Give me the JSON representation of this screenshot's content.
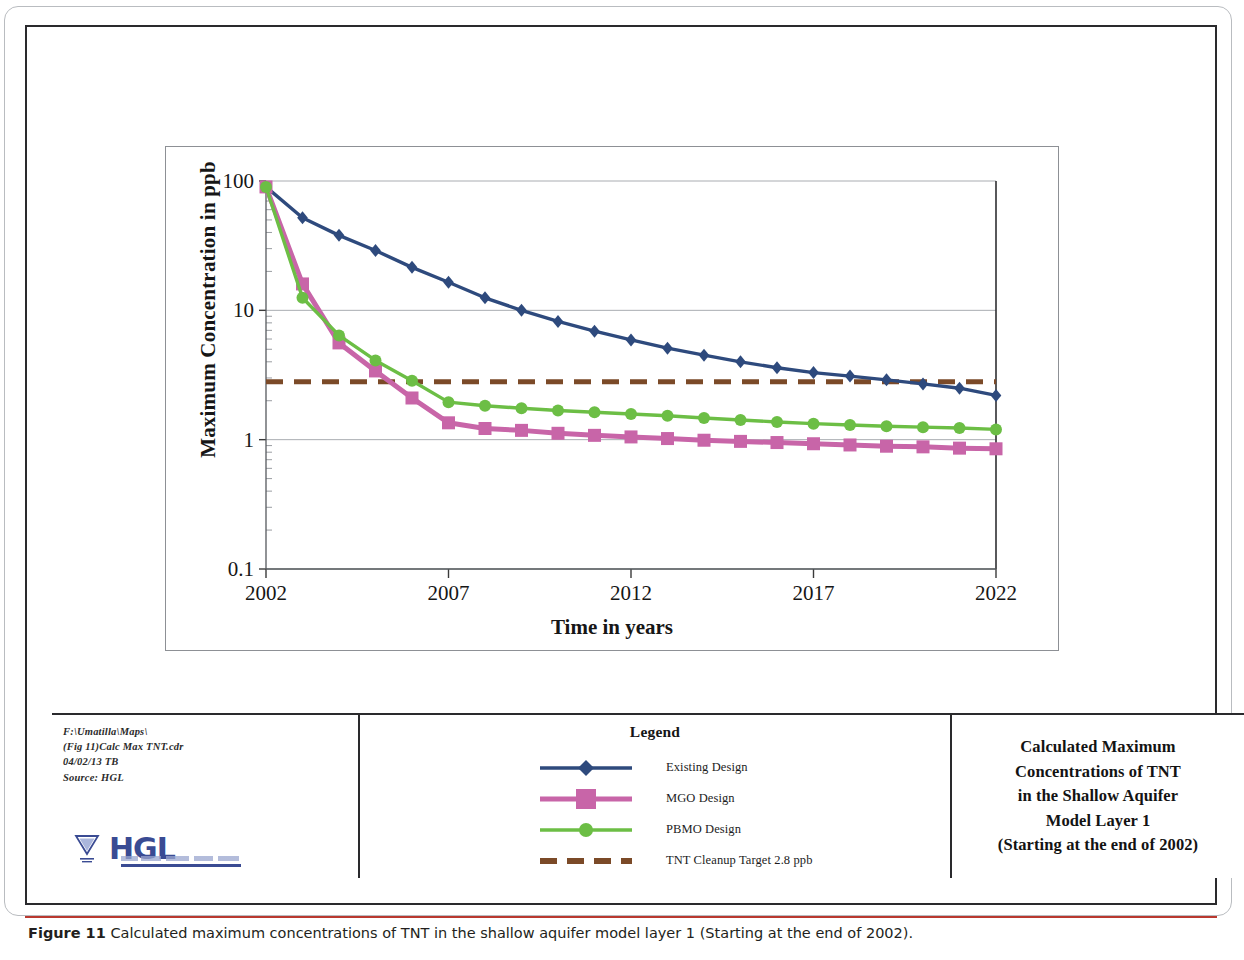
{
  "figure": {
    "caption_label": "Figure 11",
    "caption_text": "Calculated maximum concentrations of TNT in the shallow aquifer model layer 1 (Starting at the end of 2002)."
  },
  "title_block": {
    "lines": [
      "Calculated Maximum",
      "Concentrations of TNT",
      "in the Shallow Aquifer",
      "Model Layer 1",
      "(Starting at the end of 2002)"
    ]
  },
  "source_block": {
    "lines": [
      "F:\\Umatilla\\Maps\\",
      "(Fig 11)Calc Max TNT.cdr",
      "04/02/13 TB",
      "Source: HGL"
    ],
    "logo_text": "HGL"
  },
  "legend": {
    "title": "Legend",
    "entries": [
      {
        "label": "Existing Design",
        "color": "#2E4A7D",
        "marker": "diamond"
      },
      {
        "label": "MGO Design",
        "color": "#C865A8",
        "marker": "square"
      },
      {
        "label": "PBMO Design",
        "color": "#6CBE45",
        "marker": "circle"
      },
      {
        "label": "TNT Cleanup Target 2.8 ppb",
        "color": "#7B4A28",
        "marker": "dashed"
      }
    ]
  },
  "chart_data": {
    "type": "line",
    "title": "",
    "xlabel": "Time in years",
    "ylabel": "Maximum Concentration in ppb",
    "yscale": "log",
    "ylim": [
      0.1,
      100
    ],
    "yticks": [
      100,
      10,
      1,
      0.1
    ],
    "ytick_labels": [
      "100",
      "10",
      "1",
      "0.1"
    ],
    "xlim": [
      2002,
      2022
    ],
    "xticks": [
      2002,
      2007,
      2012,
      2017,
      2022
    ],
    "xtick_labels": [
      "2002",
      "2007",
      "2012",
      "2017",
      "2022"
    ],
    "grid": true,
    "legend_position": "below-figure",
    "x": [
      2002,
      2003,
      2004,
      2005,
      2006,
      2007,
      2008,
      2009,
      2010,
      2011,
      2012,
      2013,
      2014,
      2015,
      2016,
      2017,
      2018,
      2019,
      2020,
      2021,
      2022
    ],
    "series": [
      {
        "name": "Existing Design",
        "color": "#2E4A7D",
        "marker": "diamond",
        "values": [
          90,
          52,
          38,
          29,
          21.5,
          16.5,
          12.5,
          10,
          8.2,
          6.9,
          5.9,
          5.1,
          4.5,
          4.0,
          3.6,
          3.3,
          3.1,
          2.9,
          2.7,
          2.5,
          2.2
        ]
      },
      {
        "name": "MGO Design",
        "color": "#C865A8",
        "marker": "square",
        "values": [
          90,
          16,
          5.6,
          3.4,
          2.1,
          1.35,
          1.22,
          1.18,
          1.12,
          1.08,
          1.05,
          1.02,
          0.99,
          0.97,
          0.95,
          0.93,
          0.91,
          0.89,
          0.88,
          0.86,
          0.85
        ]
      },
      {
        "name": "PBMO Design",
        "color": "#6CBE45",
        "marker": "circle",
        "values": [
          90,
          12.5,
          6.4,
          4.1,
          2.85,
          1.95,
          1.83,
          1.75,
          1.68,
          1.63,
          1.58,
          1.53,
          1.47,
          1.42,
          1.37,
          1.33,
          1.3,
          1.27,
          1.25,
          1.23,
          1.2
        ]
      }
    ],
    "threshold_line": {
      "name": "TNT Cleanup Target 2.8 ppb",
      "value": 2.8,
      "color": "#7B4A28",
      "style": "dashed"
    }
  }
}
